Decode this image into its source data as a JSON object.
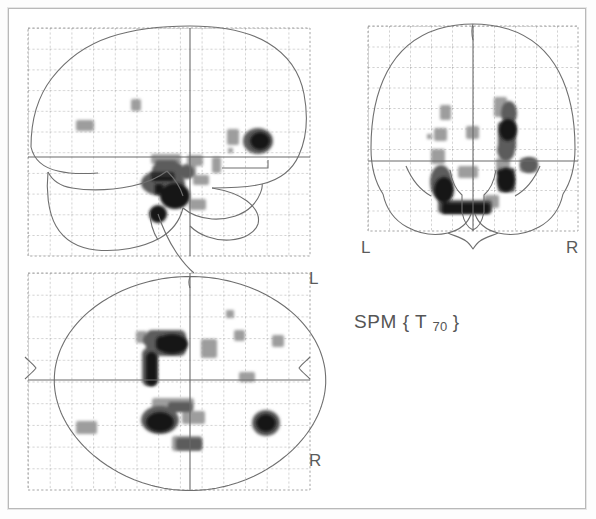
{
  "figure": {
    "kind": "spm-glass-brain-mip",
    "statistic_label": {
      "prefix": "SPM {",
      "stat": "T",
      "df": "70",
      "suffix": "}"
    },
    "background_color": "#ffffff",
    "frame_color": "#b9b9b9",
    "outline_color": "#6f6f6f",
    "grid_color": "#9a9a9a",
    "crosshair_color": "#6b6b6b",
    "blob_dark": "#1a1a1a",
    "blob_mid": "#4d4d4d",
    "blob_light": "#8e8e8e"
  },
  "panels": {
    "sagittal": {
      "name": "sagittal",
      "title": "",
      "grid": {
        "x": 28,
        "y": 28,
        "w": 282,
        "h": 228,
        "cols": 13,
        "rows": 11
      },
      "origin": {
        "x": 190,
        "y": 157
      },
      "orientation_labels": []
    },
    "coronal": {
      "name": "coronal",
      "title": "",
      "grid": {
        "x": 368,
        "y": 26,
        "w": 210,
        "h": 205,
        "cols": 10,
        "rows": 10
      },
      "origin": {
        "x": 473,
        "y": 161
      },
      "orientation_labels": [
        {
          "text": "L",
          "x": 362,
          "y": 240
        },
        {
          "text": "R",
          "x": 567,
          "y": 240
        }
      ]
    },
    "axial": {
      "name": "axial",
      "title": "",
      "grid": {
        "x": 28,
        "y": 273,
        "w": 282,
        "h": 217,
        "cols": 13,
        "rows": 10
      },
      "origin": {
        "x": 190,
        "y": 380
      },
      "orientation_labels": [
        {
          "text": "L",
          "x": 313,
          "y": 272
        },
        {
          "text": "R",
          "x": 313,
          "y": 455
        }
      ]
    }
  },
  "chart_data": {
    "type": "scatter",
    "subtitle": "Statistical parametric map, maximum-intensity projection (glass brain)",
    "statistic": "T",
    "degrees_of_freedom": 70,
    "xlabel": "",
    "ylabel": "",
    "grid": true,
    "legend": null,
    "views": [
      "sagittal",
      "coronal",
      "axial"
    ],
    "orientation_labels": [
      "L",
      "R"
    ],
    "colormap": "grayscale-inverted",
    "intensity_levels": [
      {
        "label": "low",
        "gray": "#9a9a9a"
      },
      {
        "label": "medium",
        "gray": "#555555"
      },
      {
        "label": "high",
        "gray": "#141414"
      }
    ],
    "clusters_sagittal": [
      {
        "cx": 175,
        "cy": 196,
        "rx": 17,
        "ry": 15,
        "level": "high"
      },
      {
        "cx": 163,
        "cy": 183,
        "rx": 22,
        "ry": 13,
        "level": "medium"
      },
      {
        "cx": 168,
        "cy": 170,
        "rx": 16,
        "ry": 10,
        "level": "medium"
      },
      {
        "cx": 158,
        "cy": 214,
        "rx": 9,
        "ry": 9,
        "level": "high"
      },
      {
        "cx": 187,
        "cy": 172,
        "rx": 7,
        "ry": 7,
        "level": "medium"
      },
      {
        "cx": 200,
        "cy": 180,
        "rx": 8,
        "ry": 5,
        "level": "low"
      },
      {
        "cx": 196,
        "cy": 204,
        "rx": 8,
        "ry": 6,
        "level": "low"
      },
      {
        "cx": 194,
        "cy": 160,
        "rx": 8,
        "ry": 6,
        "level": "low"
      },
      {
        "cx": 216,
        "cy": 164,
        "rx": 5,
        "ry": 8,
        "level": "low"
      },
      {
        "cx": 260,
        "cy": 141,
        "rx": 14,
        "ry": 12,
        "level": "high"
      },
      {
        "cx": 233,
        "cy": 136,
        "rx": 6,
        "ry": 8,
        "level": "low"
      },
      {
        "cx": 230,
        "cy": 150,
        "rx": 3,
        "ry": 3,
        "level": "low"
      },
      {
        "cx": 84,
        "cy": 126,
        "rx": 9,
        "ry": 6,
        "level": "low"
      },
      {
        "cx": 136,
        "cy": 105,
        "rx": 5,
        "ry": 6,
        "level": "low"
      }
    ],
    "clusters_coronal": [
      {
        "cx": 508,
        "cy": 130,
        "rx": 11,
        "ry": 13,
        "level": "high"
      },
      {
        "cx": 511,
        "cy": 110,
        "rx": 7,
        "ry": 10,
        "level": "medium"
      },
      {
        "cx": 505,
        "cy": 152,
        "rx": 8,
        "ry": 9,
        "level": "medium"
      },
      {
        "cx": 506,
        "cy": 179,
        "rx": 12,
        "ry": 14,
        "level": "high"
      },
      {
        "cx": 529,
        "cy": 165,
        "rx": 8,
        "ry": 7,
        "level": "medium"
      },
      {
        "cx": 443,
        "cy": 188,
        "rx": 11,
        "ry": 18,
        "level": "high"
      },
      {
        "cx": 438,
        "cy": 157,
        "rx": 6,
        "ry": 8,
        "level": "low"
      },
      {
        "cx": 465,
        "cy": 208,
        "rx": 27,
        "ry": 8,
        "level": "high"
      },
      {
        "cx": 492,
        "cy": 202,
        "rx": 7,
        "ry": 7,
        "level": "low"
      },
      {
        "cx": 446,
        "cy": 113,
        "rx": 6,
        "ry": 8,
        "level": "low"
      },
      {
        "cx": 441,
        "cy": 134,
        "rx": 7,
        "ry": 7,
        "level": "low"
      },
      {
        "cx": 473,
        "cy": 133,
        "rx": 7,
        "ry": 7,
        "level": "low"
      },
      {
        "cx": 429,
        "cy": 136,
        "rx": 3,
        "ry": 3,
        "level": "low"
      }
    ],
    "clusters_axial": [
      {
        "cx": 170,
        "cy": 344,
        "rx": 19,
        "ry": 11,
        "level": "high"
      },
      {
        "cx": 152,
        "cy": 340,
        "rx": 9,
        "ry": 8,
        "level": "medium"
      },
      {
        "cx": 150,
        "cy": 365,
        "rx": 8,
        "ry": 19,
        "level": "high"
      },
      {
        "cx": 140,
        "cy": 337,
        "rx": 5,
        "ry": 5,
        "level": "low"
      },
      {
        "cx": 160,
        "cy": 420,
        "rx": 18,
        "ry": 13,
        "level": "high"
      },
      {
        "cx": 172,
        "cy": 406,
        "rx": 11,
        "ry": 6,
        "level": "medium"
      },
      {
        "cx": 193,
        "cy": 418,
        "rx": 11,
        "ry": 6,
        "level": "low"
      },
      {
        "cx": 187,
        "cy": 443,
        "rx": 13,
        "ry": 7,
        "level": "medium"
      },
      {
        "cx": 266,
        "cy": 423,
        "rx": 13,
        "ry": 12,
        "level": "high"
      },
      {
        "cx": 86,
        "cy": 428,
        "rx": 10,
        "ry": 6,
        "level": "low"
      },
      {
        "cx": 210,
        "cy": 349,
        "rx": 8,
        "ry": 9,
        "level": "low"
      },
      {
        "cx": 230,
        "cy": 314,
        "rx": 4,
        "ry": 4,
        "level": "low"
      },
      {
        "cx": 240,
        "cy": 336,
        "rx": 5,
        "ry": 5,
        "level": "low"
      },
      {
        "cx": 247,
        "cy": 377,
        "rx": 8,
        "ry": 5,
        "level": "low"
      },
      {
        "cx": 278,
        "cy": 341,
        "rx": 6,
        "ry": 6,
        "level": "low"
      }
    ]
  }
}
